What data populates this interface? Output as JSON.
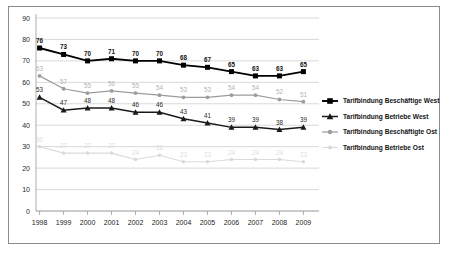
{
  "chart_data": {
    "type": "line",
    "title": "",
    "xlabel": "",
    "ylabel": "",
    "ylim": [
      0,
      90
    ],
    "grid": true,
    "legend_position": "right",
    "categories": [
      "1998",
      "1999",
      "2000",
      "2001",
      "2002",
      "2003",
      "2004",
      "2005",
      "2006",
      "2007",
      "2008",
      "2009"
    ],
    "yticks": [
      "0",
      "10",
      "20",
      "30",
      "40",
      "50",
      "60",
      "70",
      "80",
      "90"
    ],
    "series": [
      {
        "name": "Tarifbindung Beschäftige West",
        "color": "#000000",
        "marker": "square",
        "values": [
          76,
          73,
          70,
          71,
          70,
          70,
          68,
          67,
          65,
          63,
          63,
          65
        ]
      },
      {
        "name": "Tarifbindung Betriebe West",
        "color": "#1a1a1a",
        "marker": "triangle",
        "values": [
          53,
          47,
          48,
          48,
          46,
          46,
          43,
          41,
          39,
          39,
          38,
          39
        ]
      },
      {
        "name": "Tarifbindung Beschäftigte Ost",
        "color": "#9c9c9c",
        "marker": "circle",
        "values": [
          63,
          57,
          55,
          56,
          55,
          54,
          53,
          53,
          54,
          54,
          52,
          51
        ]
      },
      {
        "name": "Tarifbindung Betriebe Ost",
        "color": "#dadada",
        "marker": "circle",
        "values": [
          30,
          27,
          27,
          27,
          24,
          26,
          23,
          23,
          24,
          24,
          24,
          23
        ]
      }
    ]
  }
}
